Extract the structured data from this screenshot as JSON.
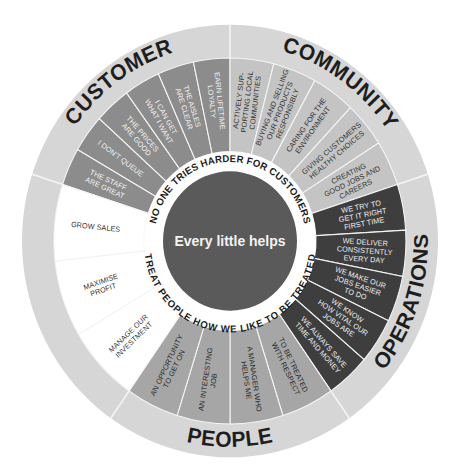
{
  "center": {
    "label": "Every little helps",
    "color": "#5a5a5a",
    "text_color": "#f2f2f2"
  },
  "ring": {
    "top_phrase": "NO ONE TRIES HARDER FOR CUSTOMERS",
    "bottom_phrase": "TREAT PEOPLE HOW WE LIKE TO BE TREATED",
    "color": "#ffffff"
  },
  "colors": {
    "outer_ring": "#d6d6d6",
    "divider": "#f4f4f4",
    "customer": "#8c8c8c",
    "community": "#c4c4c4",
    "operations": "#3e3e3e",
    "people": "#a6a6a6",
    "finance": "#ffffff"
  },
  "sectors": [
    {
      "id": "customer",
      "title": "CUSTOMER",
      "start": -162,
      "end": -90,
      "fill": "#8c8c8c",
      "text_color": "#f2f2f2",
      "items": [
        [
          "THE STAFF",
          "ARE GREAT"
        ],
        [
          "I DON'T QUEUE"
        ],
        [
          "THE PRICES",
          "ARE GOOD"
        ],
        [
          "I CAN GET",
          "WHAT I WANT"
        ],
        [
          "THE AISLES",
          "ARE CLEAR"
        ],
        [
          "EARN LIFETIME",
          "LOYALTY"
        ]
      ]
    },
    {
      "id": "community",
      "title": "COMMUNITY",
      "start": -90,
      "end": -18,
      "fill": "#c4c4c4",
      "text_color": "#333333",
      "items": [
        [
          "ACTIVELY SUP-",
          "PORTING LOCAL",
          "COMMUNITIES"
        ],
        [
          "BUYING AND SELLING",
          "OUR PRODUCTS",
          "RESPONSIBLY"
        ],
        [
          "CARING FOR THE",
          "ENVIRONMENT"
        ],
        [
          "GIVING CUSTOMERS",
          "HEALTHY CHOICES"
        ],
        [
          "CREATING",
          "GOOD JOBS AND",
          "CAREERS"
        ]
      ]
    },
    {
      "id": "operations",
      "title": "OPERATIONS",
      "start": -18,
      "end": 55,
      "fill": "#3e3e3e",
      "text_color": "#f0f0f0",
      "items": [
        [
          "WE TRY TO",
          "GET IT RIGHT",
          "FIRST TIME"
        ],
        [
          "WE DELIVER",
          "CONSISTENTLY",
          "EVERY DAY"
        ],
        [
          "WE MAKE OUR",
          "JOBS EASIER",
          "TO DO"
        ],
        [
          "WE KNOW",
          "HOW VITAL OUR",
          "JOBS ARE"
        ],
        [
          "WE ALWAYS SAVE",
          "TIME AND MONEY"
        ]
      ]
    },
    {
      "id": "people",
      "title": "PEOPLE",
      "start": 55,
      "end": 125,
      "fill": "#a6a6a6",
      "text_color": "#2a2a2a",
      "items": [
        [
          "TO BE TREATED",
          "WITH RESPECT"
        ],
        [
          "A MANAGER WHO",
          "HELPS ME"
        ],
        [
          "AN INTERESTING",
          "JOB"
        ],
        [
          "AN OPPORTUNITY",
          "TO GET ON"
        ]
      ]
    },
    {
      "id": "finance",
      "title": "FINANCE",
      "start": 125,
      "end": 198,
      "fill": "#ffffff",
      "text_color": "#333333",
      "items": [
        [
          "MANAGE OUR",
          "INVESTMENT"
        ],
        [
          "MAXIMISE",
          "PROFIT"
        ],
        [
          "GROW SALES"
        ]
      ]
    }
  ]
}
